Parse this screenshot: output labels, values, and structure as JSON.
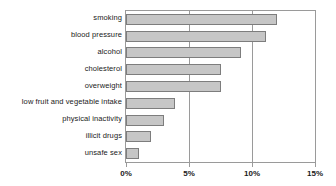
{
  "chart_data": {
    "type": "bar",
    "orientation": "horizontal",
    "title": "",
    "xlabel": "",
    "ylabel": "",
    "xlim": [
      0,
      15
    ],
    "xticks": [
      0,
      5,
      10,
      15
    ],
    "xtick_labels": [
      "0%",
      "5%",
      "10%",
      "15%"
    ],
    "grid": true,
    "grid_axis": "x",
    "legend": false,
    "categories": [
      "smoking",
      "blood pressure",
      "alcohol",
      "cholesterol",
      "overweight",
      "low fruit and vegetable intake",
      "physical inactivity",
      "illicit drugs",
      "unsafe sex"
    ],
    "values": [
      12.0,
      11.1,
      9.1,
      7.5,
      7.5,
      3.9,
      3.0,
      2.0,
      1.0
    ],
    "series": [
      {
        "name": "burden of disease",
        "values": [
          12.0,
          11.1,
          9.1,
          7.5,
          7.5,
          3.9,
          3.0,
          2.0,
          1.0
        ]
      }
    ],
    "value_unit": "%",
    "colors": {
      "bar_fill": "#c6c6c6",
      "bar_border": "#7d7d7d",
      "axis": "#9a9a9a",
      "text": "#1a1a1a",
      "background": "#ffffff"
    }
  }
}
